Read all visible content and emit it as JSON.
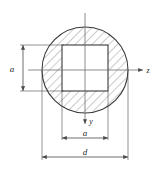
{
  "figure": {
    "labels": {
      "axis_z": "z",
      "axis_y": "y",
      "dim_a_vertical": "a",
      "dim_a_horizontal": "a",
      "dim_d": "d"
    },
    "colors": {
      "outline": "#3a3a3a",
      "hatch": "#8c8c8c",
      "centerline": "#6e6e6e",
      "dimension": "#4a4a4a",
      "text": "#2b2b2b",
      "background": "#ffffff"
    },
    "geometry": {
      "circle": {
        "cx": 85,
        "cy": 70,
        "r": 43,
        "diameter_label": "d"
      },
      "square": {
        "x": 62,
        "y": 45,
        "size": 46,
        "side_label": "a"
      }
    },
    "annotations": [
      {
        "name": "vertical-a",
        "label": "a",
        "orientation": "vertical",
        "measures": "square side"
      },
      {
        "name": "horizontal-a",
        "label": "a",
        "orientation": "horizontal",
        "measures": "square side"
      },
      {
        "name": "diameter-d",
        "label": "d",
        "orientation": "horizontal",
        "measures": "circle diameter"
      }
    ]
  }
}
